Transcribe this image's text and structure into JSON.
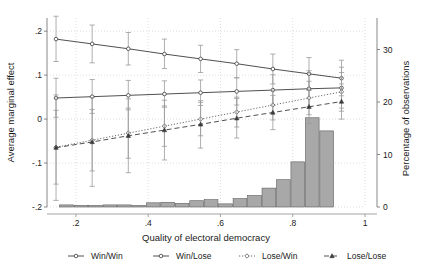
{
  "chart_data": {
    "type": "line",
    "title": "",
    "xlabel": "Quality of electoral democracy",
    "ylabel": "Average marginal effect",
    "y2label": "Percentage of observations",
    "xlim": [
      0.12,
      1.0
    ],
    "ylim": [
      -0.2,
      0.23
    ],
    "y2lim": [
      0,
      36
    ],
    "xticks": [
      0.2,
      0.4,
      0.6,
      0.8,
      1.0
    ],
    "xticklabels": [
      ".2",
      ".4",
      ".6",
      ".8",
      "1"
    ],
    "yticks": [
      -0.2,
      -0.1,
      0.0,
      0.1,
      0.2
    ],
    "yticklabels": [
      "-.2",
      "-.1",
      "0",
      ".1",
      ".2"
    ],
    "y2ticks": [
      0,
      10,
      20,
      30
    ],
    "y2ticklabels": [
      "0",
      "10",
      "20",
      "30"
    ],
    "grid": true,
    "legend_position": "below",
    "x": [
      0.145,
      0.245,
      0.345,
      0.445,
      0.545,
      0.645,
      0.745,
      0.845,
      0.935
    ],
    "series": [
      {
        "name": "Win/Win",
        "style": "solid",
        "marker": "circle",
        "color": "#3c3c3c",
        "values": [
          0.182,
          0.171,
          0.16,
          0.148,
          0.137,
          0.126,
          0.114,
          0.103,
          0.093
        ],
        "ci_lower": [
          0.131,
          0.128,
          0.123,
          0.115,
          0.106,
          0.094,
          0.08,
          0.066,
          0.053
        ],
        "ci_upper": [
          0.234,
          0.214,
          0.197,
          0.182,
          0.168,
          0.158,
          0.148,
          0.14,
          0.134
        ]
      },
      {
        "name": "Win/Lose",
        "style": "solid",
        "marker": "circle",
        "color": "#3c3c3c",
        "values": [
          0.048,
          0.051,
          0.054,
          0.057,
          0.06,
          0.063,
          0.066,
          0.069,
          0.071
        ],
        "ci_lower": [
          0.004,
          0.013,
          0.021,
          0.027,
          0.031,
          0.032,
          0.031,
          0.028,
          0.025
        ],
        "ci_upper": [
          0.093,
          0.09,
          0.088,
          0.087,
          0.089,
          0.094,
          0.101,
          0.11,
          0.118
        ]
      },
      {
        "name": "Lose/Win",
        "style": "dotted",
        "marker": "diamond",
        "color": "#5a5a5a",
        "values": [
          -0.064,
          -0.048,
          -0.032,
          -0.016,
          0.0,
          0.016,
          0.032,
          0.048,
          0.062
        ],
        "ci_lower": [
          -0.148,
          -0.118,
          -0.089,
          -0.062,
          -0.038,
          -0.018,
          -0.002,
          0.01,
          0.018
        ],
        "ci_upper": [
          0.02,
          0.022,
          0.025,
          0.03,
          0.038,
          0.05,
          0.066,
          0.086,
          0.106
        ]
      },
      {
        "name": "Lose/Lose",
        "style": "dashed",
        "marker": "triangle",
        "color": "#3c3c3c",
        "values": [
          -0.065,
          -0.052,
          -0.038,
          -0.025,
          -0.012,
          0.002,
          0.015,
          0.028,
          0.04
        ],
        "ci_lower": [
          -0.185,
          -0.153,
          -0.122,
          -0.093,
          -0.066,
          -0.043,
          -0.024,
          -0.01,
          0.0
        ],
        "ci_upper": [
          0.055,
          0.049,
          0.046,
          0.043,
          0.042,
          0.047,
          0.054,
          0.066,
          0.08
        ]
      }
    ],
    "histogram": {
      "name": "Percentage of observations",
      "color": "#a8a8a8",
      "edge_color": "#606060",
      "bin_left": [
        0.155,
        0.195,
        0.235,
        0.275,
        0.315,
        0.355,
        0.395,
        0.435,
        0.475,
        0.515,
        0.555,
        0.595,
        0.635,
        0.675,
        0.715,
        0.755,
        0.795,
        0.835,
        0.875
      ],
      "bin_width": 0.038,
      "values": [
        0.4,
        0.3,
        0.3,
        0.4,
        0.4,
        0.3,
        0.8,
        0.9,
        0.7,
        1.2,
        1.4,
        0.6,
        1.6,
        2.2,
        3.6,
        5.2,
        8.6,
        17.0,
        14.5
      ]
    }
  },
  "legend": {
    "items": [
      {
        "label": "Win/Win"
      },
      {
        "label": "Win/Lose"
      },
      {
        "label": "Lose/Win"
      },
      {
        "label": "Lose/Lose"
      }
    ]
  }
}
